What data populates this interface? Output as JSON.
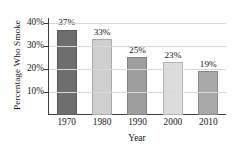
{
  "chart_data": {
    "type": "bar",
    "title": "",
    "xlabel": "Year",
    "ylabel": "Percentage Who Smoke",
    "categories": [
      "1970",
      "1980",
      "1990",
      "2000",
      "2010"
    ],
    "values": [
      37,
      33,
      25,
      23,
      19
    ],
    "value_labels": [
      "37%",
      "33%",
      "25%",
      "23%",
      "19%"
    ],
    "bar_colors": [
      "#6e6e6e",
      "#cfcfcf",
      "#9e9e9e",
      "#dcdcdc",
      "#a8a8a8"
    ],
    "ylim": [
      0,
      42
    ],
    "yticks": [
      10,
      20,
      30,
      40
    ],
    "ytick_labels": [
      "10%",
      "20%",
      "30%",
      "40%"
    ],
    "grid": true,
    "grid_axis": "y",
    "legend": "none",
    "legend_position": "none"
  }
}
